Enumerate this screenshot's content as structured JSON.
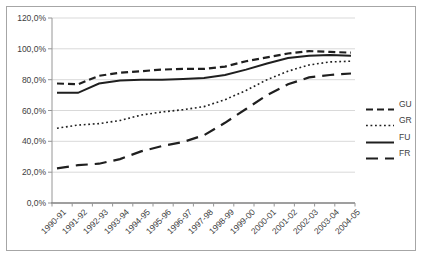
{
  "chart_data": {
    "type": "line",
    "title": "",
    "xlabel": "",
    "ylabel": "",
    "ylim": [
      0,
      120
    ],
    "grid": true,
    "legend_position": "right",
    "decimal_style": "comma",
    "categories": [
      "1990-91",
      "1991-92",
      "1992-93",
      "1993-94",
      "1994-95",
      "1995-96",
      "1996-97",
      "1997-98",
      "1998-99",
      "1999-00",
      "2000-01",
      "2001-02",
      "2002-03",
      "2003-04",
      "2004-05"
    ],
    "ytick_labels": [
      "0,0%",
      "20,0%",
      "40,0%",
      "60,0%",
      "80,0%",
      "100,0%",
      "120,0%"
    ],
    "series": [
      {
        "name": "GU",
        "style": "dashed",
        "values": [
          77.5,
          77,
          82.5,
          84.5,
          85.5,
          86.5,
          87,
          87,
          88.5,
          92,
          94.5,
          97,
          98.5,
          98,
          97.5
        ]
      },
      {
        "name": "GR",
        "style": "dotted",
        "values": [
          48.5,
          50.5,
          51.5,
          53.5,
          57,
          59,
          60.5,
          62.5,
          67,
          73,
          80,
          85.5,
          89.5,
          91.5,
          92
        ]
      },
      {
        "name": "FU",
        "style": "solid",
        "values": [
          71.5,
          71.5,
          77.5,
          79.5,
          80,
          80,
          80.5,
          81,
          83,
          86.5,
          90.5,
          94,
          95.5,
          96,
          95.5
        ]
      },
      {
        "name": "FR",
        "style": "long-dash",
        "values": [
          22.5,
          24.5,
          25.5,
          28.5,
          33.5,
          37,
          39.5,
          44,
          52,
          61,
          70,
          77,
          81.5,
          83,
          84
        ]
      }
    ],
    "colors": {
      "line": "#1f1f1f",
      "grid": "#d9d9d9",
      "axis": "#969696",
      "text": "#404040",
      "frame": "#a6a6a6",
      "background": "#ffffff"
    }
  }
}
